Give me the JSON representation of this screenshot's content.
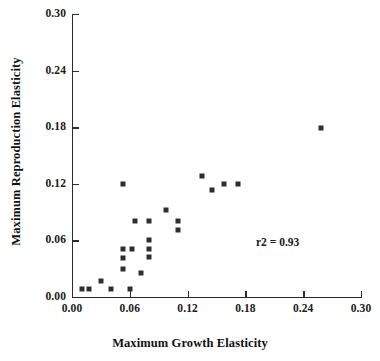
{
  "chart_data": {
    "type": "scatter",
    "title": "",
    "xlabel": "Maximum Growth Elasticity",
    "ylabel": "Maximum Reproduction Elasticity",
    "xlim": [
      0.0,
      0.3
    ],
    "ylim": [
      0.0,
      0.3
    ],
    "xticks": [
      0.0,
      0.06,
      0.12,
      0.18,
      0.24,
      0.3
    ],
    "yticks": [
      0.0,
      0.06,
      0.12,
      0.18,
      0.24,
      0.3
    ],
    "xtick_labels": [
      "0.00",
      "0.06",
      "0.12",
      "0.18",
      "0.24",
      "0.30"
    ],
    "ytick_labels": [
      "0.00",
      "0.06",
      "0.12",
      "0.18",
      "0.24",
      "0.30"
    ],
    "grid": false,
    "legend": null,
    "marker": "square",
    "marker_color": "#2e2e2e",
    "annotations": [
      {
        "text": "r2 = 0.93",
        "x": 0.191,
        "y": 0.065
      }
    ],
    "points": [
      {
        "x": 0.01,
        "y": 0.008
      },
      {
        "x": 0.018,
        "y": 0.008
      },
      {
        "x": 0.03,
        "y": 0.017
      },
      {
        "x": 0.04,
        "y": 0.008
      },
      {
        "x": 0.053,
        "y": 0.03
      },
      {
        "x": 0.053,
        "y": 0.041
      },
      {
        "x": 0.053,
        "y": 0.051
      },
      {
        "x": 0.062,
        "y": 0.051
      },
      {
        "x": 0.06,
        "y": 0.008
      },
      {
        "x": 0.053,
        "y": 0.12
      },
      {
        "x": 0.065,
        "y": 0.081
      },
      {
        "x": 0.072,
        "y": 0.025
      },
      {
        "x": 0.08,
        "y": 0.042
      },
      {
        "x": 0.08,
        "y": 0.051
      },
      {
        "x": 0.08,
        "y": 0.06
      },
      {
        "x": 0.08,
        "y": 0.081
      },
      {
        "x": 0.098,
        "y": 0.092
      },
      {
        "x": 0.11,
        "y": 0.081
      },
      {
        "x": 0.11,
        "y": 0.071
      },
      {
        "x": 0.135,
        "y": 0.128
      },
      {
        "x": 0.145,
        "y": 0.113
      },
      {
        "x": 0.158,
        "y": 0.12
      },
      {
        "x": 0.172,
        "y": 0.12
      },
      {
        "x": 0.258,
        "y": 0.179
      }
    ]
  },
  "figure": {
    "annotation_label": "r2 = 0.93"
  }
}
